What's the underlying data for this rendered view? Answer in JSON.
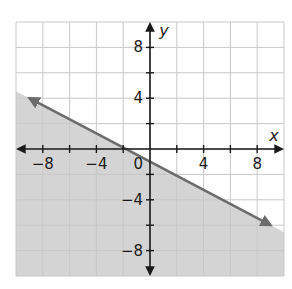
{
  "chart_data": {
    "type": "line",
    "title": "",
    "xlabel": "x",
    "ylabel": "y",
    "xlim": [
      -10,
      10
    ],
    "ylim": [
      -10,
      10
    ],
    "grid": true,
    "grid_step": 2,
    "x_ticks": [
      -8,
      -4,
      0,
      4,
      8
    ],
    "y_ticks": [
      8,
      4,
      -4,
      -8
    ],
    "x_tick_labels": [
      "−8",
      "−4",
      "0",
      "4",
      "8"
    ],
    "y_tick_labels": [
      "8",
      "4",
      "−4",
      "−8"
    ],
    "origin_label": "0",
    "series": [
      {
        "name": "boundary line",
        "style": "solid",
        "arrows": "both",
        "points": [
          [
            -9,
            4
          ],
          [
            9,
            -6
          ]
        ],
        "slope": -0.5556,
        "y_intercept": -1,
        "color": "#6b6b6b"
      }
    ],
    "shaded_region": {
      "description": "region below the line",
      "inequality": "y <= -(5/9)x - 1",
      "color": "#d4d4d4"
    }
  },
  "colors": {
    "grid": "#c8c8c8",
    "axis": "#1a1a1a",
    "shade": "#d4d4d4",
    "line": "#6b6b6b"
  }
}
